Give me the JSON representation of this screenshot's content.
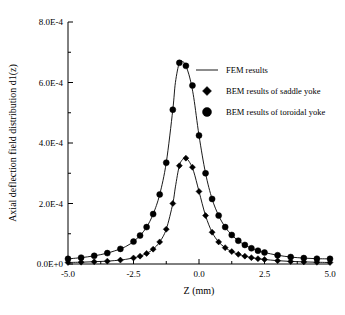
{
  "chart_data": {
    "type": "line",
    "title": "",
    "xlabel": "Z (mm)",
    "ylabel": "Axial deflection field distribution d1(z)",
    "xlim": [
      -5.0,
      5.0
    ],
    "ylim": [
      0.0,
      0.0008
    ],
    "grid": false,
    "xticks": [
      "-5.0",
      "-2.5",
      "0.0",
      "2.5",
      "5.0"
    ],
    "xtick_values": [
      -5.0,
      -2.5,
      0.0,
      2.5,
      5.0
    ],
    "yticks": [
      "0.0E+0",
      "2.0E-4",
      "4.0E-4",
      "6.0E-4",
      "8.0E-4"
    ],
    "ytick_values": [
      0.0,
      0.0002,
      0.0004,
      0.0006,
      0.0008
    ],
    "legend": {
      "position": "upper-right-inside",
      "entries": [
        {
          "name": "FEM results",
          "marker": "line",
          "label": "FEM results"
        },
        {
          "name": "saddle",
          "marker": "diamond",
          "label": "BEM results of saddle yoke"
        },
        {
          "name": "toroidal",
          "marker": "circle",
          "label": "BEM results of toroidal yoke"
        }
      ]
    },
    "series": [
      {
        "name": "FEM results (saddle)",
        "marker": "line",
        "x": [
          -5.0,
          -4.5,
          -4.0,
          -3.5,
          -3.0,
          -2.75,
          -2.5,
          -2.25,
          -2.0,
          -1.75,
          -1.5,
          -1.25,
          -1.0,
          -0.9,
          -0.75,
          -0.6,
          -0.5,
          -0.35,
          -0.2,
          0.0,
          0.25,
          0.5,
          0.75,
          1.0,
          1.25,
          1.5,
          1.75,
          2.0,
          2.25,
          2.5,
          3.0,
          3.5,
          4.0,
          4.5,
          5.0
        ],
        "y": [
          5e-06,
          6e-06,
          7.5e-06,
          9.5e-06,
          1.3e-05,
          1.6e-05,
          2e-05,
          2.6e-05,
          3.5e-05,
          4.9e-05,
          7.3e-05,
          0.000115,
          0.0002,
          0.000255,
          0.000325,
          0.000348,
          0.00035,
          0.000335,
          0.000305,
          0.00024,
          0.00016,
          0.000105,
          7.3e-05,
          5.4e-05,
          4.1e-05,
          3.2e-05,
          2.6e-05,
          2.1e-05,
          1.75e-05,
          1.5e-05,
          1.1e-05,
          8.5e-06,
          7e-06,
          5.8e-06,
          5e-06
        ]
      },
      {
        "name": "FEM results (toroidal)",
        "marker": "line",
        "x": [
          -5.0,
          -4.5,
          -4.0,
          -3.5,
          -3.0,
          -2.75,
          -2.5,
          -2.25,
          -2.0,
          -1.75,
          -1.5,
          -1.25,
          -1.0,
          -0.9,
          -0.75,
          -0.6,
          -0.5,
          -0.35,
          -0.2,
          0.0,
          0.25,
          0.5,
          0.75,
          1.0,
          1.25,
          1.5,
          1.75,
          2.0,
          2.25,
          2.5,
          3.0,
          3.5,
          4.0,
          4.5,
          5.0
        ],
        "y": [
          1.7e-05,
          2.1e-05,
          2.7e-05,
          3.6e-05,
          5e-05,
          6e-05,
          7.4e-05,
          9.4e-05,
          0.000122,
          0.000165,
          0.00023,
          0.000335,
          0.00051,
          0.0006,
          0.000665,
          0.000668,
          0.000655,
          0.000615,
          0.00055,
          0.000425,
          0.0003,
          0.000215,
          0.00016,
          0.000122,
          9.6e-05,
          7.7e-05,
          6.3e-05,
          5.2e-05,
          4.4e-05,
          3.8e-05,
          2.9e-05,
          2.3e-05,
          1.95e-05,
          1.75e-05,
          1.7e-05
        ]
      },
      {
        "name": "BEM results of saddle yoke",
        "marker": "diamond",
        "x": [
          -5.0,
          -4.5,
          -4.0,
          -3.5,
          -3.0,
          -2.5,
          -2.25,
          -2.0,
          -1.75,
          -1.5,
          -1.25,
          -1.0,
          -0.75,
          -0.5,
          -0.25,
          0.0,
          0.25,
          0.5,
          0.75,
          1.0,
          1.25,
          1.5,
          1.75,
          2.0,
          2.25,
          2.5,
          3.0,
          3.5,
          4.0,
          4.5,
          5.0
        ],
        "y": [
          5e-06,
          6e-06,
          7.5e-06,
          9.5e-06,
          1.3e-05,
          2e-05,
          2.6e-05,
          3.5e-05,
          4.9e-05,
          7.3e-05,
          0.000115,
          0.0002,
          0.000325,
          0.00035,
          0.00032,
          0.00024,
          0.00016,
          0.000105,
          7.3e-05,
          5.4e-05,
          4.1e-05,
          3.2e-05,
          2.6e-05,
          2.1e-05,
          1.75e-05,
          1.5e-05,
          1.1e-05,
          8.5e-06,
          7e-06,
          5.8e-06,
          5e-06
        ]
      },
      {
        "name": "BEM results of toroidal yoke",
        "marker": "circle",
        "x": [
          -5.0,
          -4.5,
          -4.0,
          -3.5,
          -3.0,
          -2.5,
          -2.25,
          -2.0,
          -1.75,
          -1.5,
          -1.25,
          -1.0,
          -0.75,
          -0.5,
          -0.25,
          0.0,
          0.25,
          0.5,
          0.75,
          1.0,
          1.25,
          1.5,
          1.75,
          2.0,
          2.25,
          2.5,
          3.0,
          3.5,
          4.0,
          4.5,
          5.0
        ],
        "y": [
          1.7e-05,
          2.1e-05,
          2.7e-05,
          3.6e-05,
          5e-05,
          7.4e-05,
          9.4e-05,
          0.000122,
          0.000165,
          0.00023,
          0.000335,
          0.00051,
          0.000665,
          0.000655,
          0.00059,
          0.000425,
          0.0003,
          0.000215,
          0.00016,
          0.000122,
          9.6e-05,
          7.7e-05,
          6.3e-05,
          5.2e-05,
          4.4e-05,
          3.8e-05,
          2.9e-05,
          2.3e-05,
          1.95e-05,
          1.75e-05,
          1.7e-05
        ]
      }
    ]
  },
  "colors": {
    "axis": "#000000",
    "line": "#000000",
    "marker": "#000000",
    "background": "#ffffff"
  }
}
